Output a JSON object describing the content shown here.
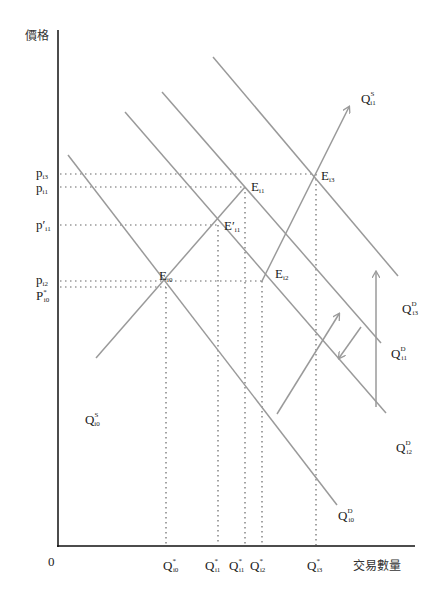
{
  "axes": {
    "y_label": "價格",
    "x_label": "交易數量",
    "origin_label": "0"
  },
  "price_labels": [
    {
      "id": "p_i3",
      "main": "p",
      "sub": "i3",
      "sup": "",
      "prime": ""
    },
    {
      "id": "p_i1",
      "main": "p",
      "sub": "i1",
      "sup": "",
      "prime": ""
    },
    {
      "id": "p_prime_i1",
      "main": "p",
      "sub": "i1",
      "sup": "",
      "prime": "′"
    },
    {
      "id": "p_i2",
      "main": "p",
      "sub": "i2",
      "sup": "",
      "prime": ""
    },
    {
      "id": "P_star_i0",
      "main": "P",
      "sub": "i0",
      "sup": "*",
      "prime": ""
    }
  ],
  "quantity_labels": [
    {
      "id": "Q_star_i0",
      "main": "Q",
      "sub": "i0",
      "sup": "*"
    },
    {
      "id": "Q_star_i1_a",
      "main": "Q",
      "sub": "i1",
      "sup": "*"
    },
    {
      "id": "Q_star_i1_b",
      "main": "Q",
      "sub": "i1",
      "sup": "*"
    },
    {
      "id": "Q_star_i2",
      "main": "Q",
      "sub": "i2",
      "sup": "*"
    },
    {
      "id": "Q_star_i3",
      "main": "Q",
      "sub": "i3",
      "sup": "*"
    }
  ],
  "equilibrium_labels": [
    {
      "id": "E_i0",
      "main": "E",
      "sub": "i0",
      "prime": ""
    },
    {
      "id": "E_prime_i1",
      "main": "E",
      "sub": "i1",
      "prime": "′"
    },
    {
      "id": "E_i1",
      "main": "E",
      "sub": "i1",
      "prime": ""
    },
    {
      "id": "E_i2",
      "main": "E",
      "sub": "i2",
      "prime": ""
    },
    {
      "id": "E_i3",
      "main": "E",
      "sub": "i3",
      "prime": ""
    }
  ],
  "curve_labels": [
    {
      "id": "Q_S_i0",
      "main": "Q",
      "sub": "i0",
      "sup": "S"
    },
    {
      "id": "Q_S_i1",
      "main": "Q",
      "sub": "i1",
      "sup": "S"
    },
    {
      "id": "Q_D_i0",
      "main": "Q",
      "sub": "i0",
      "sup": "D"
    },
    {
      "id": "Q_D_i1",
      "main": "Q",
      "sub": "i1",
      "sup": "D"
    },
    {
      "id": "Q_D_i2",
      "main": "Q",
      "sub": "i2",
      "sup": "D"
    },
    {
      "id": "Q_D_i3",
      "main": "Q",
      "sub": "i3",
      "sup": "D"
    }
  ]
}
